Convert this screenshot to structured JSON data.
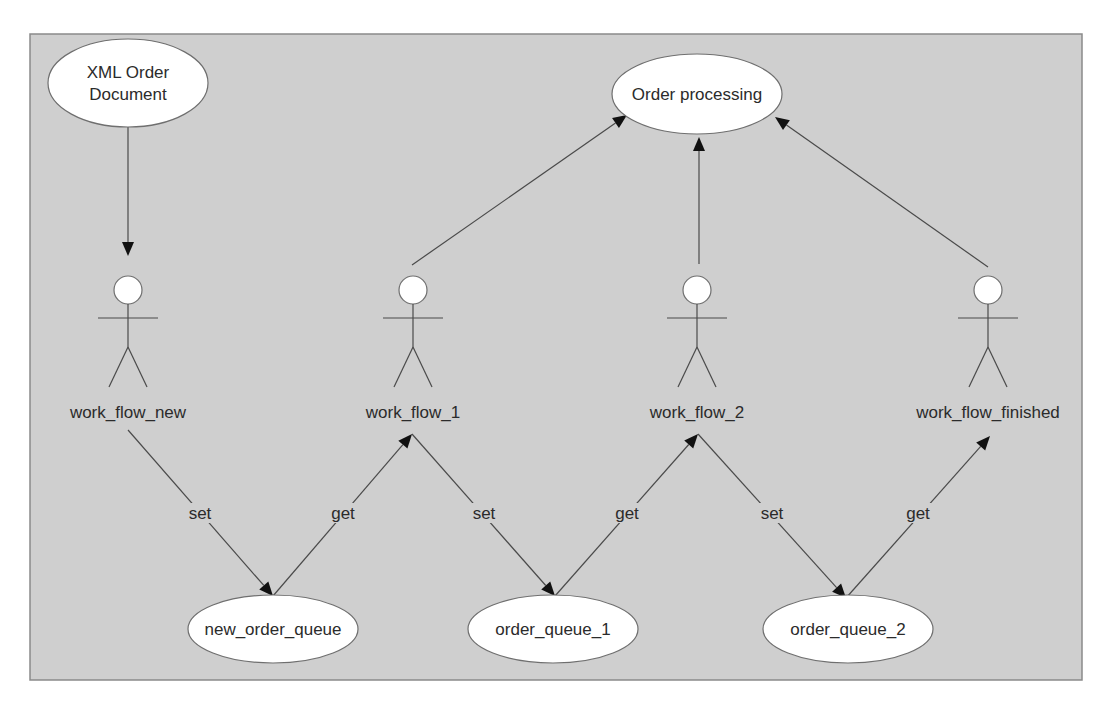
{
  "diagram": {
    "colors": {
      "frame_fill": "#cfcfcf",
      "frame_stroke": "#8a8a8a",
      "node_fill": "#ffffff",
      "edge": "#4a4a4a",
      "text": "#2b2b2b"
    },
    "use_cases": [
      {
        "id": "xml_order_document",
        "lines": [
          "XML Order",
          "Document"
        ],
        "cx": 128,
        "cy": 83,
        "rx": 80,
        "ry": 44
      },
      {
        "id": "order_processing",
        "lines": [
          "Order processing"
        ],
        "cx": 697,
        "cy": 94,
        "rx": 85,
        "ry": 40
      },
      {
        "id": "new_order_queue",
        "lines": [
          "new_order_queue"
        ],
        "cx": 273,
        "cy": 629,
        "rx": 85,
        "ry": 34
      },
      {
        "id": "order_queue_1",
        "lines": [
          "order_queue_1"
        ],
        "cx": 553,
        "cy": 629,
        "rx": 85,
        "ry": 34
      },
      {
        "id": "order_queue_2",
        "lines": [
          "order_queue_2"
        ],
        "cx": 848,
        "cy": 629,
        "rx": 85,
        "ry": 34
      }
    ],
    "actors": [
      {
        "id": "work_flow_new",
        "label": "work_flow_new",
        "x": 128,
        "y": 290
      },
      {
        "id": "work_flow_1",
        "label": "work_flow_1",
        "x": 413,
        "y": 290
      },
      {
        "id": "work_flow_2",
        "label": "work_flow_2",
        "x": 697,
        "y": 290
      },
      {
        "id": "work_flow_finished",
        "label": "work_flow_finished",
        "x": 988,
        "y": 290
      }
    ],
    "edges": [
      {
        "from": "xml_order_document",
        "to": "work_flow_new",
        "x1": 128,
        "y1": 127,
        "x2": 128,
        "y2": 256,
        "label": ""
      },
      {
        "from": "work_flow_1",
        "to": "order_processing",
        "x1": 412,
        "y1": 265,
        "x2": 627,
        "y2": 115,
        "label": ""
      },
      {
        "from": "work_flow_2",
        "to": "order_processing",
        "x1": 699,
        "y1": 264,
        "x2": 699,
        "y2": 137,
        "label": ""
      },
      {
        "from": "work_flow_finished",
        "to": "order_processing",
        "x1": 988,
        "y1": 267,
        "x2": 775,
        "y2": 117,
        "label": ""
      },
      {
        "from": "work_flow_new",
        "to": "new_order_queue",
        "x1": 128,
        "y1": 430,
        "x2": 273,
        "y2": 596,
        "label": "set",
        "lx": 200,
        "ly": 517
      },
      {
        "from": "new_order_queue",
        "to": "work_flow_1",
        "x1": 273,
        "y1": 596,
        "x2": 412,
        "y2": 434,
        "label": "get",
        "lx": 343,
        "ly": 517
      },
      {
        "from": "work_flow_1",
        "to": "order_queue_1",
        "x1": 412,
        "y1": 434,
        "x2": 555,
        "y2": 596,
        "label": "set",
        "lx": 484,
        "ly": 517
      },
      {
        "from": "order_queue_1",
        "to": "work_flow_2",
        "x1": 555,
        "y1": 596,
        "x2": 698,
        "y2": 434,
        "label": "get",
        "lx": 627,
        "ly": 517
      },
      {
        "from": "work_flow_2",
        "to": "order_queue_2",
        "x1": 698,
        "y1": 434,
        "x2": 846,
        "y2": 598,
        "label": "set",
        "lx": 772,
        "ly": 517
      },
      {
        "from": "order_queue_2",
        "to": "work_flow_finished",
        "x1": 846,
        "y1": 598,
        "x2": 990,
        "y2": 436,
        "label": "get",
        "lx": 918,
        "ly": 517
      }
    ]
  }
}
